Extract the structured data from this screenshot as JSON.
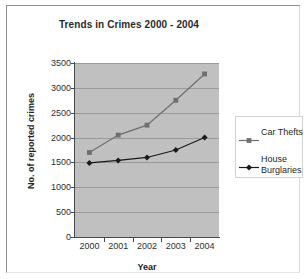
{
  "chart_data": {
    "type": "line",
    "title": "Trends in Crimes 2000 - 2004",
    "xlabel": "Year",
    "ylabel": "No. of reported crimes",
    "categories": [
      "2000",
      "2001",
      "2002",
      "2003",
      "2004"
    ],
    "ylim": [
      0,
      3500
    ],
    "y_ticks": [
      0,
      500,
      1000,
      1500,
      2000,
      2500,
      3000,
      3500
    ],
    "y_tick_labels": [
      "0",
      "500",
      "1000",
      "1500",
      "2000",
      "2500",
      "3000",
      "3500"
    ],
    "grid": true,
    "legend_position": "right",
    "plot_background": "#c0c0c0",
    "series": [
      {
        "name": "Car Thefts",
        "values": [
          1700,
          2050,
          2250,
          2750,
          3280
        ],
        "color": "#6e6e6e",
        "marker": "square"
      },
      {
        "name": "House Burglaries",
        "values": [
          1490,
          1540,
          1600,
          1750,
          2000
        ],
        "color": "#1a1a1a",
        "marker": "diamond"
      }
    ]
  },
  "legend": {
    "entries": [
      {
        "label": "Car Thefts",
        "label_line1": "Car Thefts",
        "label_line2": ""
      },
      {
        "label": "House Burglaries",
        "label_line1": "House",
        "label_line2": "Burglaries"
      }
    ]
  }
}
